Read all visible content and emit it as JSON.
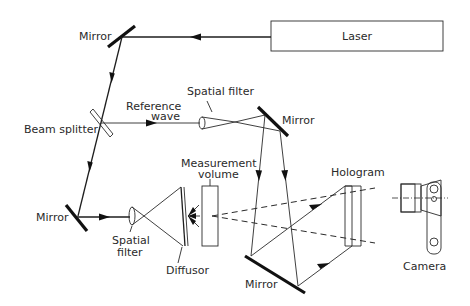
{
  "components": {
    "laser": "Laser",
    "mirror_top_left": "Mirror",
    "mirror_right": "Mirror",
    "mirror_lower_left": "Mirror",
    "mirror_bottom": "Mirror",
    "beam_splitter": "Beam splitter",
    "reference_wave_line1": "Reference",
    "reference_wave_line2": "wave",
    "spatial_filter_ref": "Spatial filter",
    "spatial_filter_obj_line1": "Spatial",
    "spatial_filter_obj_line2": "filter",
    "measurement_volume_line1": "Measurement",
    "measurement_volume_line2": "volume",
    "diffusor": "Diffusor",
    "hologram": "Hologram",
    "camera": "Camera"
  }
}
